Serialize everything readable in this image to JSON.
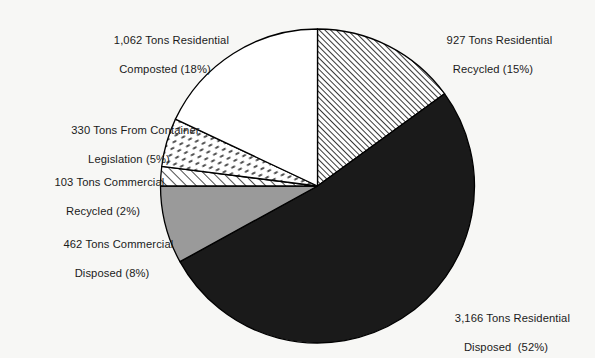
{
  "chart_data": {
    "type": "pie",
    "title": "",
    "subtitle": "",
    "xlabel": "",
    "ylabel": "",
    "legend_position": "callout-labels",
    "grid": false,
    "units": "Tons",
    "total_tons": 6050,
    "categories": [
      "Residential Recycled",
      "Residential Disposed",
      "Commercial Disposed",
      "Commercial Recycled",
      "From Container Legislation",
      "Residential Composted"
    ],
    "values": [
      927,
      3166,
      462,
      103,
      330,
      1062
    ],
    "percents": [
      15,
      52,
      8,
      2,
      5,
      18
    ],
    "slices": [
      {
        "key": "residential-recycled",
        "label_line1": "927 Tons Residential",
        "label_line2": "Recycled (15%)",
        "value": 927,
        "percent": 15,
        "fill": "diagonal-hatch",
        "color": "#ffffff",
        "start_angle": 0,
        "end_angle": 54
      },
      {
        "key": "residential-disposed",
        "label_line1": "3,166 Tons Residential",
        "label_line2": "Disposed  (52%)",
        "value": 3166,
        "percent": 52,
        "fill": "solid",
        "color": "#1a1a1a",
        "start_angle": 54,
        "end_angle": 241.2
      },
      {
        "key": "commercial-disposed",
        "label_line1": "462 Tons Commercial",
        "label_line2": "Disposed (8%)",
        "value": 462,
        "percent": 8,
        "fill": "solid",
        "color": "#9a9a9a",
        "start_angle": 241.2,
        "end_angle": 270
      },
      {
        "key": "commercial-recycled",
        "label_line1": "103 Tons Commercial",
        "label_line2": "Recycled (2%)",
        "value": 103,
        "percent": 2,
        "fill": "thin-diagonal-hatch",
        "color": "#ffffff",
        "start_angle": 270,
        "end_angle": 277.2
      },
      {
        "key": "container-legislation",
        "label_line1": "330 Tons From Container",
        "label_line2": "Legislation (5%)",
        "value": 330,
        "percent": 5,
        "fill": "dash-speckle",
        "color": "#ffffff",
        "start_angle": 277.2,
        "end_angle": 295.2
      },
      {
        "key": "residential-composted",
        "label_line1": "1,062 Tons Residential",
        "label_line2": "Composted (18%)",
        "value": 1062,
        "percent": 18,
        "fill": "none",
        "color": "#ffffff",
        "start_angle": 295.2,
        "end_angle": 360
      }
    ],
    "geometry": {
      "center_x": 317.5,
      "center_y": 186,
      "radius": 157
    },
    "colors": {
      "background": "#f7f7f5",
      "outline": "#000000",
      "text": "#1b1b1b",
      "solid_dark": "#1a1a1a",
      "solid_gray": "#9a9a9a",
      "white": "#ffffff"
    }
  }
}
